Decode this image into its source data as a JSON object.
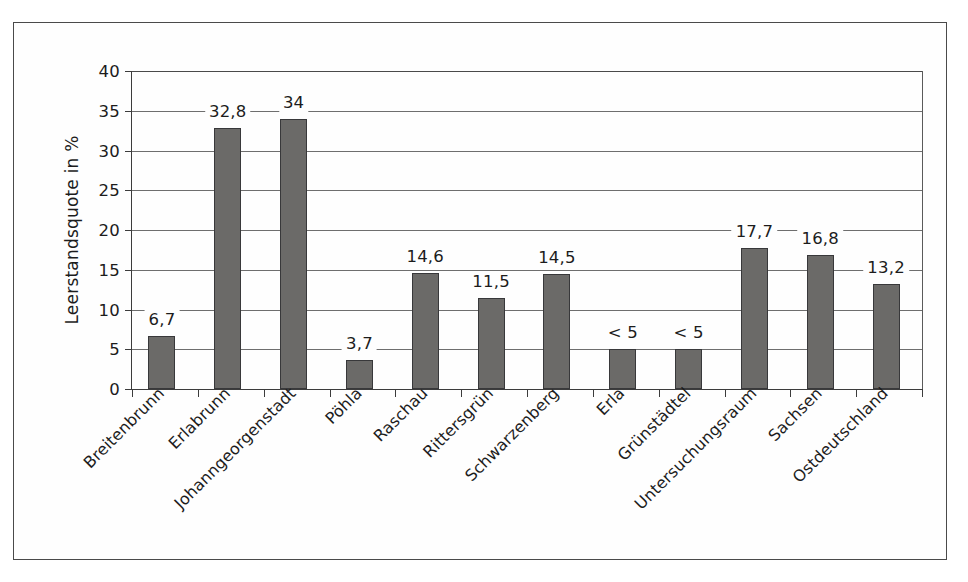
{
  "chart_data": {
    "type": "bar",
    "title": "",
    "subtitle": "",
    "xlabel": "",
    "ylabel": "Leerstandsquote in %",
    "ylim": [
      0,
      40
    ],
    "ytick_values": [
      0,
      5,
      10,
      15,
      20,
      25,
      30,
      35,
      40
    ],
    "ytick_labels": [
      "0",
      "5",
      "10",
      "15",
      "20",
      "25",
      "30",
      "35",
      "40"
    ],
    "grid": true,
    "legend": null,
    "legend_position": "none",
    "categories": [
      "Breitenbrunn",
      "Erlabrunn",
      "Johanngeorgenstadt",
      "Pöhla",
      "Raschau",
      "Rittersgrün",
      "Schwarzenberg",
      "Erla",
      "Grünstädtel",
      "Untersuchungsraum",
      "Sachsen",
      "Ostdeutschland"
    ],
    "values": [
      6.7,
      32.8,
      34,
      3.7,
      14.6,
      11.5,
      14.5,
      5,
      5,
      17.7,
      16.8,
      13.2
    ],
    "data_labels": [
      "6,7",
      "32,8",
      "34",
      "3,7",
      "14,6",
      "11,5",
      "14,5",
      "< 5",
      "< 5",
      "17,7",
      "16,8",
      "13,2"
    ],
    "bar_color": "#6b6a68",
    "bar_edge_color": "#38383a",
    "gridline_color": "#6e6e6e",
    "axis_color": "#3c3c3c",
    "frame_color": "#4a4a4a",
    "background_color": "#fefefe"
  }
}
